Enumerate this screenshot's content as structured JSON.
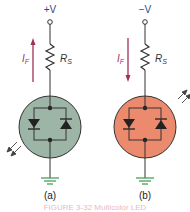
{
  "circuits": [
    {
      "supply_label": "+V",
      "current_label": "I",
      "current_sub": "F",
      "current_direction": "up",
      "resistor_label": "R",
      "resistor_sub": "S",
      "led_fill": "#9db5a6",
      "light_direction": "incoming",
      "sub_caption": "(a)"
    },
    {
      "supply_label": "−V",
      "current_label": "I",
      "current_sub": "F",
      "current_direction": "down",
      "resistor_label": "R",
      "resistor_sub": "S",
      "led_fill": "#ec8a6e",
      "light_direction": "outgoing",
      "sub_caption": "(b)"
    }
  ],
  "colors": {
    "wire": "#333333",
    "label_blue": "#2a4a8a",
    "current_arrow": "#a0305a",
    "ground_green": "#3a9a4a"
  },
  "caption": "FIGURE 3-32   Multicolor LED"
}
